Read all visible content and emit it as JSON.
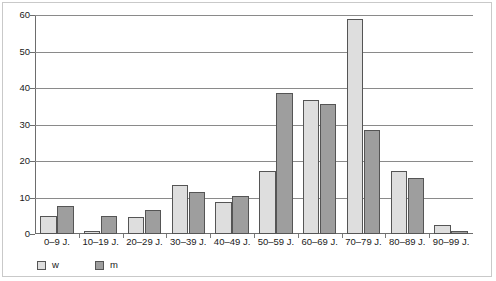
{
  "chart_data": {
    "type": "bar",
    "title": "",
    "xlabel": "",
    "ylabel": "",
    "ylim": [
      0,
      60
    ],
    "yticks": [
      0,
      10,
      20,
      30,
      40,
      50,
      60
    ],
    "grid": true,
    "legend_position": "bottom-left",
    "categories": [
      "0–9 J.",
      "10–19 J.",
      "20–29 J.",
      "30–39 J.",
      "40–49 J.",
      "50–59 J.",
      "60–69 J.",
      "70–79 J.",
      "80–89 J.",
      "90–99 J."
    ],
    "series": [
      {
        "name": "w",
        "color": "#dedede",
        "values": [
          4.8,
          0.7,
          4.7,
          13.5,
          8.7,
          17.3,
          36.8,
          59.0,
          17.3,
          2.5
        ]
      },
      {
        "name": "m",
        "color": "#9e9e9e",
        "values": [
          7.8,
          4.8,
          6.6,
          11.5,
          10.4,
          38.5,
          35.5,
          28.5,
          15.3,
          0.7
        ]
      }
    ]
  },
  "legend": {
    "items": [
      {
        "label": "w",
        "color": "#dedede"
      },
      {
        "label": "m",
        "color": "#9e9e9e"
      }
    ]
  },
  "axes": {
    "y_tick_labels": [
      "60",
      "50",
      "40",
      "30",
      "20",
      "10",
      "0"
    ]
  }
}
